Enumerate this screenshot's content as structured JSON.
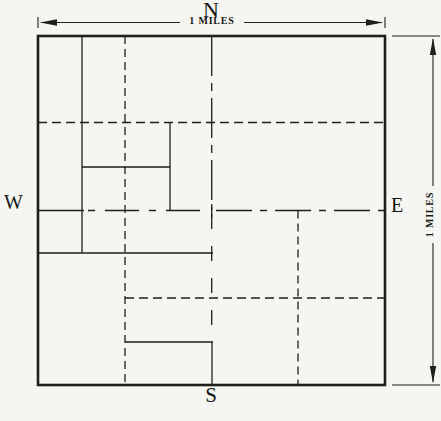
{
  "figure": {
    "type": "land-survey-section-diagram",
    "compass": {
      "north": "N",
      "south": "S",
      "east": "E",
      "west": "W"
    },
    "scales": {
      "top": "1 MILES",
      "right": "1 MILES"
    },
    "colors": {
      "line": "#1f1e1c",
      "background": "#f5f5f2",
      "label": "#151513"
    }
  }
}
